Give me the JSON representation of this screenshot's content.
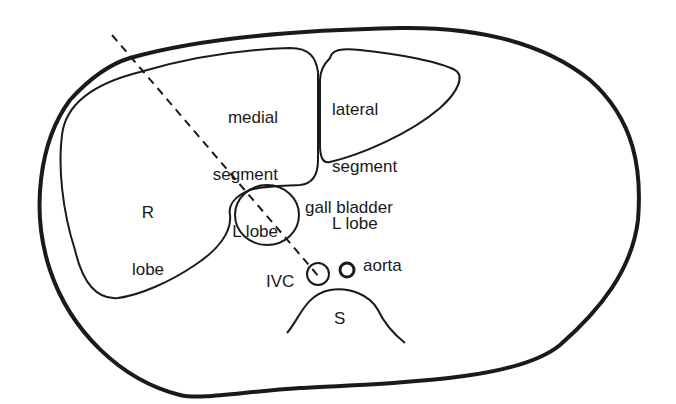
{
  "diagram": {
    "type": "anatomical cross-section (transverse abdomen, liver)",
    "labels": {
      "medial": [
        "medial",
        "segment",
        "L lobe"
      ],
      "lateral": [
        "lateral",
        "segment",
        "L lobe"
      ],
      "r_lobe": [
        "R",
        "lobe"
      ],
      "gall_bladder": "gall bladder",
      "ivc": "IVC",
      "aorta": "aorta",
      "spine": "S"
    },
    "colors": {
      "line": "#1a1a1a",
      "background": "#ffffff"
    }
  }
}
